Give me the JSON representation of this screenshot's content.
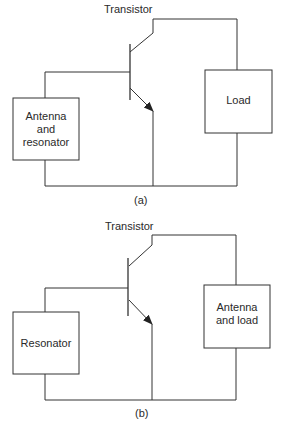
{
  "figure_a": {
    "caption": "(a)",
    "transistor_label": "Transistor",
    "left_box": {
      "line1": "Antenna",
      "line2": "and",
      "line3": "resonator"
    },
    "right_box": {
      "line1": "Load"
    }
  },
  "figure_b": {
    "caption": "(b)",
    "transistor_label": "Transistor",
    "left_box": {
      "line1": "Resonator"
    },
    "right_box": {
      "line1": "Antenna",
      "line2": "and load"
    }
  },
  "colors": {
    "line": "#333333",
    "background": "#ffffff"
  }
}
